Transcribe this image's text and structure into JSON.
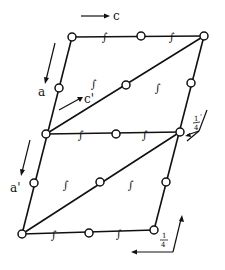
{
  "diagram": {
    "type": "crystallographic unit cell projection",
    "labels": {
      "axis_c": "c",
      "axis_c_prime": "c'",
      "axis_a": "a",
      "axis_a_prime": "a'",
      "quarter_upper_num": "1",
      "quarter_upper_den": "4",
      "quarter_upper_prime": "'",
      "quarter_lower_num": "1",
      "quarter_lower_den": "4"
    },
    "vertices": {
      "top_left": [
        72,
        37
      ],
      "top_right": [
        204,
        36
      ],
      "mid_left": [
        46,
        134
      ],
      "mid_right": [
        180,
        132
      ],
      "bot_left": [
        22,
        234
      ],
      "bot_right": [
        154,
        230
      ]
    },
    "inversion_centers": [
      [
        72,
        37
      ],
      [
        141,
        36
      ],
      [
        204,
        36
      ],
      [
        59,
        88
      ],
      [
        126,
        85
      ],
      [
        191,
        83
      ],
      [
        46,
        134
      ],
      [
        116,
        134
      ],
      [
        180,
        132
      ],
      [
        34,
        183
      ],
      [
        100,
        182
      ],
      [
        166,
        182
      ],
      [
        22,
        234
      ],
      [
        89,
        233
      ],
      [
        154,
        230
      ]
    ],
    "screw_axis_symbol": "∫",
    "colors": {
      "line": "#111111",
      "background": "#ffffff"
    }
  }
}
